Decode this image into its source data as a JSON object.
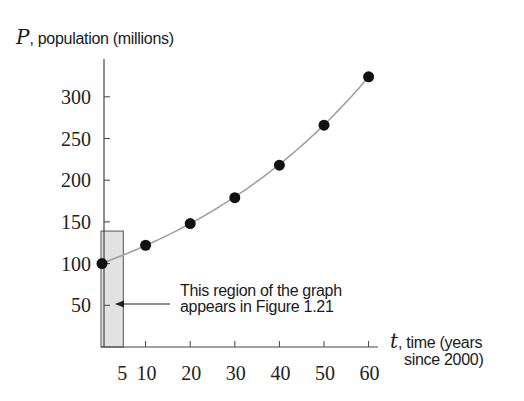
{
  "chart_data": {
    "type": "scatter",
    "title": "",
    "ylabel": {
      "var": "P",
      "text": ", population (millions)"
    },
    "xlabel": {
      "var": "t",
      "line1": ", time (years",
      "line2": "since 2000)"
    },
    "x": [
      0,
      10,
      20,
      30,
      40,
      50,
      60
    ],
    "series": [
      {
        "name": "population",
        "values": [
          100,
          122,
          148,
          179,
          218,
          266,
          324
        ],
        "marker": "filled-circle",
        "color": "#111111"
      }
    ],
    "curve": {
      "type": "exponential-fit",
      "color": "#a0a0a0"
    },
    "xlim": [
      0,
      62
    ],
    "ylim": [
      0,
      345
    ],
    "xticks": [
      5,
      10,
      20,
      30,
      40,
      50,
      60
    ],
    "xtick_labels": [
      "5",
      "10",
      "20",
      "30",
      "40",
      "50",
      "60"
    ],
    "yticks": [
      50,
      100,
      150,
      200,
      250,
      300
    ],
    "ytick_labels": [
      "50",
      "100",
      "150",
      "200",
      "250",
      "300"
    ],
    "grid": false,
    "shaded_region": {
      "x0": 0,
      "x1": 5,
      "y0": 0,
      "y1": 139,
      "color": "#e2e2e2"
    },
    "annotation": {
      "line1": "This region of the graph",
      "line2": "appears in Figure 1.21",
      "arrow_target": "shaded_region"
    }
  }
}
